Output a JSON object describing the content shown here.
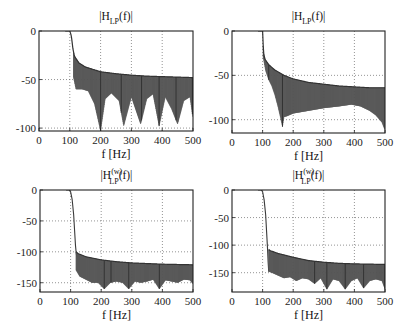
{
  "figure": {
    "colors": {
      "curve": "#3a3a3a",
      "fill": "#555555",
      "grid": "#666666",
      "axis": "#222222"
    }
  },
  "chart_data": [
    {
      "type": "line",
      "title": "|H_LP(f)|",
      "title_main": "|H",
      "title_sub": "LP",
      "title_sup": "",
      "title_tail": "(f)|",
      "xlabel": "f [Hz]",
      "ylabel": "",
      "xlim": [
        0,
        500
      ],
      "ylim": [
        -103,
        0
      ],
      "xticks": [
        0,
        100,
        200,
        300,
        400,
        500
      ],
      "yticks": [
        0,
        -50,
        -100
      ],
      "grid": true,
      "box": {
        "x0": 39,
        "x1": 193,
        "y0": 31,
        "y1": 131
      },
      "passband_edge": 100,
      "stopband_start": 112,
      "envelope_upper": {
        "x": [
          100,
          105,
          110,
          115,
          130,
          150,
          200,
          250,
          300,
          350,
          400,
          450,
          500
        ],
        "y": [
          0,
          -5,
          -18,
          -26,
          -33,
          -37,
          -42,
          -44,
          -45.5,
          -46.5,
          -47,
          -47.5,
          -48
        ]
      },
      "envelope_lower": {
        "x": [
          112,
          120,
          140,
          160,
          180,
          200,
          215,
          235,
          260,
          275,
          300,
          330,
          350,
          370,
          390,
          410,
          430,
          450,
          470,
          490,
          500
        ],
        "y": [
          -48,
          -60,
          -60,
          -62,
          -75,
          -103,
          -70,
          -64,
          -72,
          -98,
          -68,
          -96,
          -70,
          -65,
          -98,
          -68,
          -80,
          -96,
          -72,
          -68,
          -90
        ]
      },
      "notches": [
        200,
        267,
        333,
        390,
        445,
        498
      ]
    },
    {
      "type": "line",
      "title": "|H_LP(f)|",
      "title_main": "|H",
      "title_sub": "LP",
      "title_sup": "",
      "title_tail": "(f)|",
      "xlabel": "f [Hz]",
      "ylabel": "",
      "xlim": [
        0,
        500
      ],
      "ylim": [
        -115,
        0
      ],
      "xticks": [
        0,
        100,
        200,
        300,
        400,
        500
      ],
      "yticks": [
        0,
        -50,
        -100
      ],
      "grid": true,
      "box": {
        "x0": 232,
        "x1": 385,
        "y0": 31,
        "y1": 133
      },
      "passband_edge": 100,
      "stopband_start": 102,
      "envelope_upper": {
        "x": [
          100,
          103,
          108,
          120,
          140,
          170,
          200,
          250,
          300,
          350,
          400,
          450,
          500
        ],
        "y": [
          0,
          -25,
          -32,
          -38,
          -44,
          -50,
          -54,
          -58,
          -60,
          -62,
          -63,
          -64,
          -64
        ]
      },
      "envelope_lower": {
        "x": [
          102,
          110,
          120,
          130,
          140,
          150,
          160,
          165,
          170,
          180,
          200,
          250,
          300,
          350,
          390,
          420,
          450,
          470,
          490,
          500
        ],
        "y": [
          -30,
          -45,
          -55,
          -62,
          -72,
          -85,
          -100,
          -108,
          -97,
          -96,
          -93,
          -90,
          -87,
          -85,
          -83,
          -85,
          -90,
          -95,
          -103,
          -112
        ]
      },
      "notches": [
        120,
        165
      ]
    },
    {
      "type": "line",
      "title": "|H_LP^(w)(f)|",
      "title_main": "|H",
      "title_sub": "LP",
      "title_sup": "(w)",
      "title_tail": "(f)|",
      "xlabel": "f [Hz]",
      "ylabel": "",
      "xlim": [
        0,
        500
      ],
      "ylim": [
        -165,
        0
      ],
      "xticks": [
        0,
        100,
        200,
        300,
        400,
        500
      ],
      "yticks": [
        0,
        -50,
        -100,
        -150
      ],
      "grid": true,
      "box": {
        "x0": 40,
        "x1": 193,
        "y0": 190,
        "y1": 292
      },
      "passband_edge": 100,
      "transition": {
        "x": [
          90,
          95,
          100,
          105,
          110,
          113,
          116,
          118,
          120
        ],
        "y": [
          0,
          0,
          -3,
          -15,
          -40,
          -65,
          -90,
          -100,
          -108
        ]
      },
      "stopband_start": 118,
      "envelope_upper": {
        "x": [
          118,
          125,
          150,
          200,
          250,
          300,
          350,
          400,
          450,
          500
        ],
        "y": [
          -100,
          -103,
          -108,
          -113,
          -116,
          -118,
          -119,
          -120,
          -120.5,
          -121
        ]
      },
      "envelope_lower": {
        "x": [
          118,
          130,
          150,
          170,
          190,
          210,
          230,
          250,
          270,
          290,
          310,
          330,
          350,
          370,
          390,
          410,
          430,
          450,
          470,
          490,
          500
        ],
        "y": [
          -130,
          -140,
          -145,
          -150,
          -150,
          -160,
          -150,
          -148,
          -150,
          -160,
          -148,
          -150,
          -148,
          -145,
          -160,
          -146,
          -148,
          -150,
          -145,
          -146,
          -152
        ]
      },
      "notches": [
        210,
        232,
        290,
        390
      ]
    },
    {
      "type": "line",
      "title": "|H_LP^(w)(f)|",
      "title_main": "|H",
      "title_sub": "LP",
      "title_sup": "(w)",
      "title_tail": "(f)|",
      "xlabel": "f [Hz]",
      "ylabel": "",
      "xlim": [
        0,
        500
      ],
      "ylim": [
        -185,
        0
      ],
      "xticks": [
        0,
        100,
        200,
        300,
        400,
        500
      ],
      "yticks": [
        0,
        -50,
        -100,
        -150
      ],
      "grid": true,
      "box": {
        "x0": 232,
        "x1": 385,
        "y0": 190,
        "y1": 292
      },
      "passband_edge": 100,
      "transition": {
        "x": [
          90,
          95,
          100,
          105,
          110,
          113,
          116,
          118,
          120
        ],
        "y": [
          0,
          0,
          -3,
          -18,
          -45,
          -75,
          -105,
          -130,
          -148
        ]
      },
      "stopband_start": 120,
      "envelope_upper": {
        "x": [
          120,
          125,
          150,
          200,
          250,
          300,
          350,
          400,
          450,
          500
        ],
        "y": [
          -108,
          -110,
          -115,
          -122,
          -128,
          -131,
          -133,
          -134,
          -134.5,
          -135
        ]
      },
      "envelope_lower": {
        "x": [
          120,
          130,
          150,
          170,
          190,
          210,
          230,
          250,
          270,
          290,
          310,
          330,
          350,
          370,
          390,
          410,
          430,
          450,
          470,
          490,
          500
        ],
        "y": [
          -148,
          -150,
          -155,
          -160,
          -158,
          -165,
          -160,
          -162,
          -170,
          -160,
          -180,
          -162,
          -165,
          -180,
          -165,
          -160,
          -178,
          -165,
          -162,
          -165,
          -180
        ]
      },
      "notches": [
        270,
        310,
        370,
        430,
        500
      ]
    }
  ]
}
